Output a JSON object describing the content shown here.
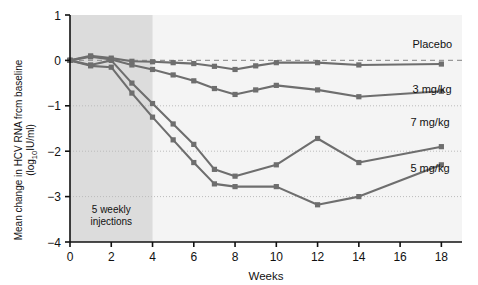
{
  "chart_data": {
    "type": "line",
    "title": "",
    "xlabel": "Weeks",
    "ylabel_line1": "Mean change in HCV RNA frcm baseline",
    "ylabel_line2_pre": "(log",
    "ylabel_line2_sub": "10",
    "ylabel_line2_post": "IU/ml)",
    "xlim": [
      0,
      19
    ],
    "ylim": [
      -4,
      1
    ],
    "xticks": [
      0,
      2,
      4,
      6,
      8,
      10,
      12,
      14,
      16,
      18
    ],
    "xtick_labels": [
      "0",
      "2",
      "4",
      "6",
      "8",
      "10",
      "12",
      "14",
      "16",
      "18"
    ],
    "yticks": [
      1,
      0,
      -1,
      -2,
      -3,
      -4
    ],
    "ytick_labels": [
      "1",
      "0",
      "−1",
      "−2",
      "−3",
      "−4"
    ],
    "gridlines_y": [
      -1,
      -2,
      -3
    ],
    "grid": true,
    "zero_reference_line": 0,
    "legend_position": "right-inline",
    "shaded_region": {
      "x_start": 0,
      "x_end": 4,
      "label_line1": "5 weekly",
      "label_line2": "injections",
      "color": "#dcdcdc"
    },
    "colors": {
      "line": "#6e6e6e",
      "marker": "#6e6e6e",
      "shade": "#dcdcdc",
      "plot_background": "#f4f4f4",
      "grid": "#bbbbbb",
      "axis": "#111111"
    },
    "series": [
      {
        "name": "Placebo",
        "label": "Placebo",
        "x": [
          0,
          1,
          2,
          3,
          4,
          5,
          6,
          7,
          8,
          9,
          10,
          12,
          14,
          18
        ],
        "values": [
          0.0,
          0.1,
          0.05,
          -0.02,
          -0.03,
          -0.05,
          -0.07,
          -0.13,
          -0.2,
          -0.12,
          -0.05,
          -0.05,
          -0.1,
          -0.08
        ],
        "label_x": 16.6,
        "label_y": 0.28
      },
      {
        "name": "3 mg/kg",
        "label": "3 mg/kg",
        "x": [
          0,
          1,
          2,
          3,
          4,
          5,
          6,
          7,
          8,
          9,
          10,
          12,
          14,
          18
        ],
        "values": [
          0.0,
          0.08,
          0.02,
          -0.1,
          -0.2,
          -0.32,
          -0.45,
          -0.62,
          -0.75,
          -0.65,
          -0.55,
          -0.65,
          -0.8,
          -0.68
        ],
        "label_x": 16.6,
        "label_y": -0.72
      },
      {
        "name": "7 mg/kg",
        "label": "7 mg/kg",
        "x": [
          0,
          1,
          2,
          3,
          4,
          5,
          6,
          7,
          8,
          10,
          12,
          14,
          18
        ],
        "values": [
          0.0,
          -0.1,
          0.0,
          -0.5,
          -0.95,
          -1.4,
          -1.85,
          -2.4,
          -2.55,
          -2.3,
          -1.72,
          -2.25,
          -1.9
        ],
        "label_x": 16.5,
        "label_y": -1.45
      },
      {
        "name": "5 mg/kg",
        "label": "5 mg/kg",
        "x": [
          0,
          1,
          2,
          3,
          4,
          5,
          6,
          7,
          8,
          10,
          12,
          14,
          18
        ],
        "values": [
          0.0,
          -0.12,
          -0.15,
          -0.72,
          -1.25,
          -1.75,
          -2.25,
          -2.72,
          -2.78,
          -2.78,
          -3.18,
          -3.0,
          -2.3
        ],
        "label_x": 16.5,
        "label_y": -2.45
      }
    ]
  }
}
